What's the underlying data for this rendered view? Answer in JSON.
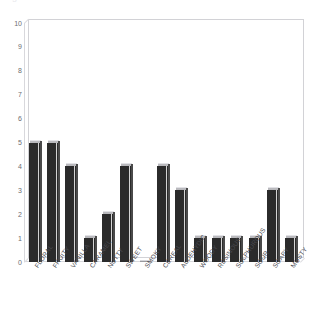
{
  "figure": {
    "ghost_top_text": "a  g",
    "background_color": "#ffffff",
    "bar_color": "#2b2b2b",
    "bar_top_face_color": "#b9b9bd",
    "axis_color": "#d2d2d6",
    "tick_label_color": "#6d6d72"
  },
  "chart_data": {
    "type": "bar",
    "title": "",
    "subtitle": "",
    "xlabel": "",
    "ylabel": "",
    "ylim": [
      0,
      10
    ],
    "yticks": [
      0,
      1,
      2,
      3,
      4,
      5,
      6,
      7,
      8,
      9,
      10
    ],
    "ytick_labels": [
      "0",
      "1",
      "2",
      "3",
      "4",
      "5",
      "6",
      "7",
      "8",
      "9",
      "10"
    ],
    "grid": false,
    "legend": false,
    "legend_position": "none",
    "style": "3d-column",
    "xtick_rotation": -55,
    "categories": [
      "FLORAL",
      "FRUITY",
      "VANILLA",
      "CARAMEL",
      "NUTTY",
      "SWEET",
      "SMOKY",
      "CEREAL",
      "ALDEHYDIC",
      "WOODY",
      "RESINOUS",
      "SULPHUROUS",
      "SOUR",
      "SOAPY",
      "MUSTY"
    ],
    "values": [
      5,
      5,
      4,
      1,
      2,
      4,
      0,
      4,
      3,
      1,
      1,
      1,
      1,
      3,
      1
    ],
    "series": [
      {
        "name": "",
        "values": [
          5,
          5,
          4,
          1,
          2,
          4,
          0,
          4,
          3,
          1,
          1,
          1,
          1,
          3,
          1
        ]
      }
    ]
  }
}
